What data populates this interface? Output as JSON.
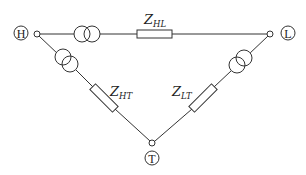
{
  "diagram": {
    "type": "three-winding transformer delta equivalent circuit",
    "nodes": [
      {
        "id": "H",
        "label": "H"
      },
      {
        "id": "L",
        "label": "L"
      },
      {
        "id": "T",
        "label": "T"
      }
    ],
    "branches": [
      {
        "from": "H",
        "to": "L",
        "impedance": {
          "main": "Z",
          "sub": "HL"
        },
        "has_transformer": true
      },
      {
        "from": "H",
        "to": "T",
        "impedance": {
          "main": "Z",
          "sub": "HT"
        },
        "has_transformer": true
      },
      {
        "from": "L",
        "to": "T",
        "impedance": {
          "main": "Z",
          "sub": "LT"
        },
        "has_transformer": true
      }
    ],
    "colors": {
      "stroke": "#333333",
      "background": "#ffffff"
    }
  }
}
